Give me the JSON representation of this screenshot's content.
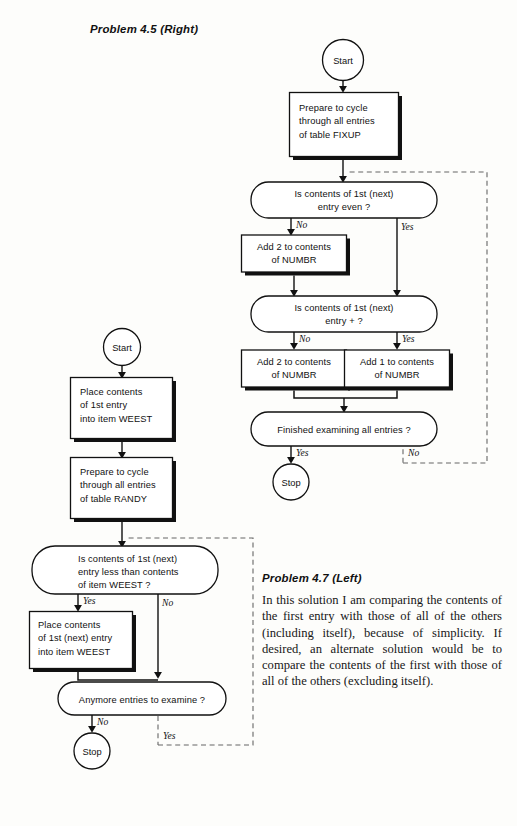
{
  "headings": {
    "right": "Problem 4.5 (Right)",
    "left": "Problem 4.7 (Left)"
  },
  "paragraph": {
    "text": "In this solution I am comparing the con­tents of the first entry with those of all of the others (including itself), because of simplicity. If desired, an alternate solu­tion would be to compare the contents of the first with those of all of the others (excluding itself)."
  },
  "colors": {
    "ink": "#111111",
    "page": "#fdfdfb",
    "shadow": "#111111",
    "dashed": "#555555"
  },
  "right_flowchart": {
    "title": "Problem 4.5 (Right)",
    "nodes": {
      "start": {
        "shape": "circle",
        "label": "Start"
      },
      "prepare": {
        "shape": "process",
        "lines": [
          "Prepare to cycle",
          "through all entries",
          "of table FIXUP"
        ]
      },
      "decision_even": {
        "shape": "decision",
        "lines": [
          "Is contents of 1st (next)",
          "entry even ?"
        ]
      },
      "add2_a": {
        "shape": "process",
        "lines": [
          "Add 2 to contents",
          "of NUMBR"
        ]
      },
      "decision_plus": {
        "shape": "decision",
        "lines": [
          "Is contents of 1st (next)",
          "entry + ?"
        ]
      },
      "add2_b": {
        "shape": "process",
        "lines": [
          "Add 2 to contents",
          "of NUMBR"
        ]
      },
      "add1": {
        "shape": "process",
        "lines": [
          "Add 1 to contents",
          "of NUMBR"
        ]
      },
      "decision_done": {
        "shape": "decision",
        "lines": [
          "Finished examining all entries ?"
        ]
      },
      "stop": {
        "shape": "circle",
        "label": "Stop"
      }
    },
    "branch_labels": {
      "even_no": "No",
      "even_yes": "Yes",
      "plus_no": "No",
      "plus_yes": "Yes",
      "done_yes": "Yes",
      "done_no": "No"
    }
  },
  "left_flowchart": {
    "title": "Problem 4.7 (Left)",
    "nodes": {
      "start": {
        "shape": "circle",
        "label": "Start"
      },
      "place_first": {
        "shape": "process",
        "lines": [
          "Place contents",
          "of 1st entry",
          "into item WEEST"
        ]
      },
      "prepare": {
        "shape": "process",
        "lines": [
          "Prepare to cycle",
          "through all entries",
          "of table RANDY"
        ]
      },
      "decision_less": {
        "shape": "decision",
        "lines": [
          "Is contents of 1st (next)",
          "entry less than contents",
          "of item WEEST ?"
        ]
      },
      "place_next": {
        "shape": "process",
        "lines": [
          "Place contents",
          "of 1st (next) entry",
          "into item WEEST"
        ]
      },
      "decision_more": {
        "shape": "decision",
        "lines": [
          "Anymore entries to examine ?"
        ]
      },
      "stop": {
        "shape": "circle",
        "label": "Stop"
      }
    },
    "branch_labels": {
      "less_yes": "Yes",
      "less_no": "No",
      "more_no": "No",
      "more_yes": "Yes"
    }
  }
}
